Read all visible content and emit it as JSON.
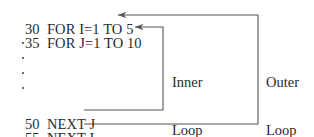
{
  "figure": {
    "width": 314,
    "height": 137,
    "background": "#ffffff",
    "ink_color": "#2b2b2b",
    "line_color": "#555555"
  },
  "code": {
    "lines": [
      {
        "number": "30",
        "text": "FOR I=1 TO 5",
        "x": 10,
        "y": 8
      },
      {
        "number": "35",
        "text": "FOR J=1 TO 10",
        "x": 10,
        "y": 21
      },
      {
        "number": "50",
        "text": "NEXT J",
        "x": 10,
        "y": 103
      },
      {
        "number": "55",
        "text": "NEXT I",
        "x": 10,
        "y": 117
      }
    ]
  },
  "ellipsis": {
    "label": "vertical-ellipsis",
    "count": 4,
    "x": 22,
    "ys": [
      42,
      57,
      72,
      87
    ]
  },
  "annotations": {
    "inner": {
      "line1": "Inner",
      "line2": "Loop",
      "x": 172,
      "y": 42
    },
    "outer": {
      "line1": "Outer",
      "line2": "Loop",
      "x": 266,
      "y": 42
    }
  },
  "brackets": {
    "inner_loop": {
      "name": "inner-loop-arrow",
      "top_arrow_tip_x": 135,
      "top_y": 27,
      "right_x": 163,
      "bottom_y": 110,
      "bottom_arrow_tip_x": 84,
      "describes": "from line 50 NEXT J back up to line 35 FOR J=1 TO 10"
    },
    "outer_loop": {
      "name": "outer-loop-arrow",
      "top_arrow_tip_x": 118,
      "top_y": 15,
      "right_x": 258,
      "bottom_y": 124,
      "bottom_arrow_tip_x": 84,
      "describes": "from line 55 NEXT I back up to line 30 FOR I=1 TO 5"
    }
  }
}
